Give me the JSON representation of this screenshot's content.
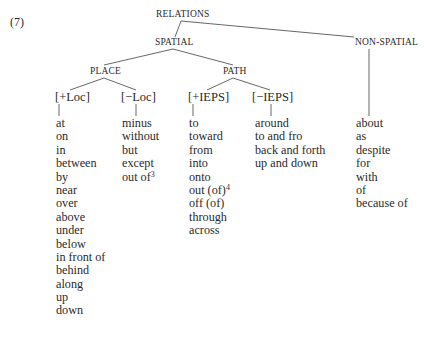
{
  "example_number": "(7)",
  "tree": {
    "root": "RELATIONS",
    "spatial": {
      "label": "SPATIAL",
      "place": {
        "label": "PLACE",
        "plus_loc": {
          "label": "[+Loc]",
          "items": [
            "at",
            "on",
            "in",
            "between",
            "by",
            "near",
            "over",
            "above",
            "under",
            "below",
            "in front of",
            "behind",
            "along",
            "up",
            "down"
          ]
        },
        "minus_loc": {
          "label": "[−Loc]",
          "items": [
            "minus",
            "without",
            "but",
            "except"
          ],
          "last_item": "out of",
          "last_item_footnote": "3"
        }
      },
      "path": {
        "label": "PATH",
        "plus_ieps": {
          "label": "[+IEPS]",
          "items_before": [
            "to",
            "toward",
            "from",
            "into",
            "onto"
          ],
          "footnoted_item": "out (of)",
          "footnote": "4",
          "items_after": [
            "off (of)",
            "through",
            "across"
          ]
        },
        "minus_ieps": {
          "label": "[−IEPS]",
          "items": [
            "around",
            "to and fro",
            "back and forth",
            "up and down"
          ]
        }
      }
    },
    "non_spatial": {
      "label": "NON-SPATIAL",
      "items": [
        "about",
        "as",
        "despite",
        "for",
        "with",
        "of",
        "because of"
      ]
    }
  }
}
